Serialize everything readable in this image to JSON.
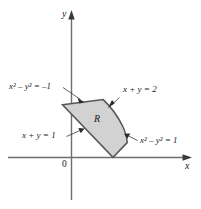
{
  "figure": {
    "background_color": "#ffffff",
    "axis_color": "#6e6e6e",
    "region_fill_color": "#d2d2d2",
    "region_stroke_color": "#55555a",
    "leader_color": "#3a3a3a",
    "text_color": "#1a1a1a"
  },
  "axes": {
    "x_label": "x",
    "y_label": "y",
    "origin_label": "0"
  },
  "region": {
    "label": "R"
  },
  "annotations": [
    {
      "name": "hyperbola-neg-one",
      "base": "x",
      "exp1": "2",
      "mid": " – ",
      "base2": "y",
      "exp2": "2",
      "eq": " = –1",
      "full_text": "x² – y² = –1"
    },
    {
      "name": "line-sum-two",
      "full_text": "x + y = 2"
    },
    {
      "name": "line-sum-one",
      "full_text": "x + y = 1"
    },
    {
      "name": "hyperbola-one",
      "base": "x",
      "exp1": "2",
      "mid": " – ",
      "base2": "y",
      "exp2": "2",
      "eq": " = 1",
      "full_text": "x² – y² = 1"
    }
  ],
  "labels": {
    "hyp_neg1_base": "x",
    "hyp_neg1_sup1": "2",
    "hyp_neg1_minus": "–",
    "hyp_neg1_base2": "y",
    "hyp_neg1_sup2": "2",
    "hyp_neg1_eq": "= –1",
    "line2": "x + y = 2",
    "line1": "x + y = 1",
    "hyp1_base": "x",
    "hyp1_sup1": "2",
    "hyp1_minus": "–",
    "hyp1_base2": "y",
    "hyp1_sup2": "2",
    "hyp1_eq": "= 1"
  }
}
